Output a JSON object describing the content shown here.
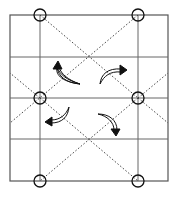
{
  "diagram": {
    "type": "origami-fold-diagram",
    "width": 176,
    "height": 200,
    "colors": {
      "background": "#ffffff",
      "frame": "#555555",
      "crease_solid": "#666666",
      "crease_dotted": "#444444",
      "marker": "#111111",
      "arrow_fill": "#ffffff",
      "arrow_stroke": "#111111"
    },
    "frame": {
      "x": 10,
      "y": 15,
      "width": 158,
      "height": 166
    },
    "vertical_lines": [
      40,
      138
    ],
    "horizontal_lines": [
      57,
      98,
      139
    ],
    "dotted_lines": [
      {
        "x1": 40,
        "y1": 15,
        "x2": 138,
        "y2": 98
      },
      {
        "x1": 138,
        "y1": 15,
        "x2": 10,
        "y2": 123
      },
      {
        "x1": 40,
        "y1": 98,
        "x2": 138,
        "y2": 181
      },
      {
        "x1": 138,
        "y1": 98,
        "x2": 40,
        "y2": 181
      },
      {
        "x1": 40,
        "y1": 98,
        "x2": 10,
        "y2": 73
      },
      {
        "x1": 138,
        "y1": 98,
        "x2": 168,
        "y2": 73
      },
      {
        "x1": 138,
        "y1": 98,
        "x2": 168,
        "y2": 123
      }
    ],
    "reference_points": [
      {
        "name": "top-left",
        "x": 40,
        "y": 15
      },
      {
        "name": "top-right",
        "x": 138,
        "y": 15
      },
      {
        "name": "middle-left",
        "x": 40,
        "y": 98
      },
      {
        "name": "middle-right",
        "x": 138,
        "y": 98
      },
      {
        "name": "bottom-left",
        "x": 40,
        "y": 181
      },
      {
        "name": "bottom-right",
        "x": 138,
        "y": 181
      }
    ],
    "marker_radius": 6,
    "fold_arrows": [
      {
        "name": "top-left",
        "direction": "up-left"
      },
      {
        "name": "top-right",
        "direction": "up-right"
      },
      {
        "name": "bottom-left",
        "direction": "down-left"
      },
      {
        "name": "bottom-right",
        "direction": "down-right"
      }
    ]
  }
}
